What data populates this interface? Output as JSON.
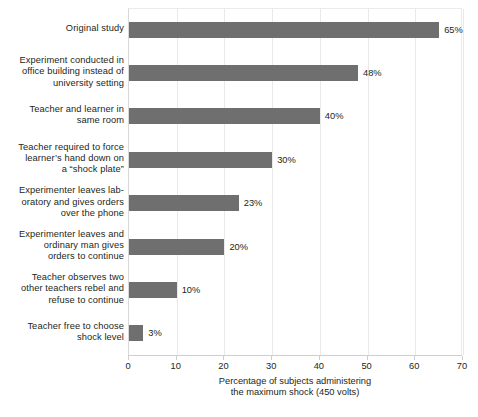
{
  "chart_data": {
    "type": "bar",
    "orientation": "horizontal",
    "title": "",
    "xlabel": "Percentage of subjects administering\nthe maximum shock (450 volts)",
    "ylabel": "",
    "xlim": [
      0,
      70
    ],
    "xticks": [
      0,
      10,
      20,
      30,
      40,
      50,
      60,
      70
    ],
    "grid": true,
    "legend": false,
    "bar_color": "#6f6f6f",
    "categories": [
      "Original study",
      "Experiment conducted in\noffice building instead of\nuniversity setting",
      "Teacher and learner in\nsame room",
      "Teacher required to force\nlearner’s hand down on\na “shock plate”",
      "Experimenter leaves lab-\noratory and gives orders\nover the phone",
      "Experimenter leaves and\nordinary man gives\norders to continue",
      "Teacher observes two\nother teachers rebel and\nrefuse to continue",
      "Teacher free to choose\nshock level"
    ],
    "values": [
      65,
      48,
      40,
      30,
      23,
      20,
      10,
      3
    ],
    "value_labels": [
      "65%",
      "48%",
      "40%",
      "30%",
      "23%",
      "20%",
      "10%",
      "3%"
    ],
    "tick_labels": [
      "0",
      "10",
      "20",
      "30",
      "40",
      "50",
      "60",
      "70"
    ]
  }
}
